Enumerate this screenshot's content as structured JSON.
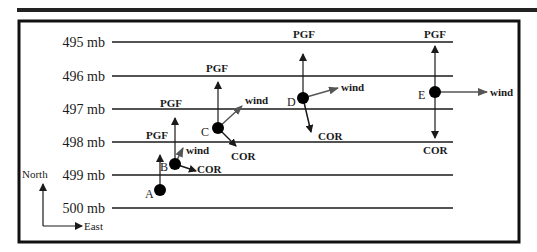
{
  "diagram": {
    "isobars": [
      {
        "label": "495 mb",
        "pressure": 495
      },
      {
        "label": "496 mb",
        "pressure": 496
      },
      {
        "label": "497 mb",
        "pressure": 497
      },
      {
        "label": "498 mb",
        "pressure": 498
      },
      {
        "label": "499 mb",
        "pressure": 499
      },
      {
        "label": "500 mb",
        "pressure": 500
      }
    ],
    "compass": {
      "north": "North",
      "east": "East"
    },
    "points": [
      {
        "id": "A",
        "label": "A",
        "pgf": "PGF",
        "wind": "",
        "cor": ""
      },
      {
        "id": "B",
        "label": "B",
        "pgf": "PGF",
        "wind": "wind",
        "cor": "COR"
      },
      {
        "id": "C",
        "label": "C",
        "pgf": "PGF",
        "wind": "wind",
        "cor": "COR"
      },
      {
        "id": "D",
        "label": "D",
        "pgf": "PGF",
        "wind": "wind",
        "cor": "COR"
      },
      {
        "id": "E",
        "label": "E",
        "pgf": "PGF",
        "wind": "wind",
        "cor": "COR"
      }
    ],
    "colors": {
      "line": "#1a1a1a",
      "wind": "#555555"
    }
  }
}
